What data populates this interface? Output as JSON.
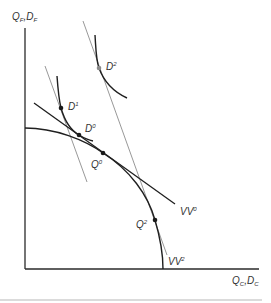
{
  "diagram": {
    "type": "trade-theory-ppf",
    "axes": {
      "y_label": {
        "main1": "Q",
        "sub1": "F",
        "sep": ",",
        "main2": "D",
        "sub2": "F"
      },
      "x_label": {
        "main1": "Q",
        "sub1": "C",
        "sep": ",",
        "main2": "D",
        "sub2": "C"
      }
    },
    "points": [
      {
        "id": "D1",
        "base": "D",
        "sup": "1",
        "color": "#1a1a1a"
      },
      {
        "id": "D0",
        "base": "D",
        "sup": "0",
        "color": "#1a1a1a"
      },
      {
        "id": "Q0",
        "base": "Q",
        "sup": "0",
        "color": "#1a1a1a"
      },
      {
        "id": "Q2",
        "base": "Q",
        "sup": "2",
        "color": "#1a1a1a"
      },
      {
        "id": "D2",
        "base": "D",
        "sup": "2",
        "color": "#8a8a8a"
      }
    ],
    "lines": [
      {
        "id": "VV0",
        "base": "VV",
        "sup": "0"
      },
      {
        "id": "VV2",
        "base": "VV",
        "sup": "2"
      }
    ],
    "curves": [
      "production-possibility-frontier",
      "indifference-curve-low",
      "indifference-curve-high"
    ],
    "colors": {
      "axis": "#2a2a2a",
      "curve": "#1f1f1f",
      "gray_line": "#8c8c8c",
      "divider": "#cfcfcf"
    }
  }
}
